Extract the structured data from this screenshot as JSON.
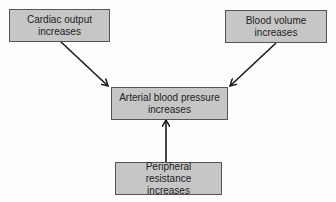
{
  "diagram": {
    "nodes": [
      {
        "id": "cardiac",
        "lines": [
          "Cardiac output",
          "increases"
        ]
      },
      {
        "id": "blood_volume",
        "lines": [
          "Blood volume",
          "increases"
        ]
      },
      {
        "id": "arterial",
        "lines": [
          "Arterial blood pressure",
          "increases"
        ]
      },
      {
        "id": "peripheral",
        "lines": [
          "Peripheral resistance",
          "increases"
        ]
      }
    ],
    "edges": [
      {
        "from": "cardiac",
        "to": "arterial"
      },
      {
        "from": "blood_volume",
        "to": "arterial"
      },
      {
        "from": "peripheral",
        "to": "arterial"
      }
    ],
    "colors": {
      "box_fill": "#c6c6c6",
      "box_border": "#555555",
      "arrow": "#1a1a1a"
    }
  }
}
